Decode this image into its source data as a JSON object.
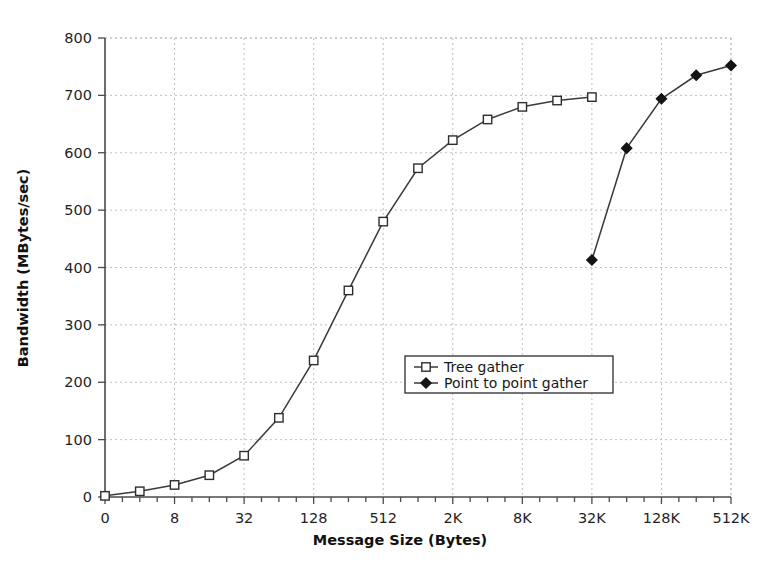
{
  "chart_data": {
    "type": "line",
    "title": "",
    "xlabel": "Message Size (Bytes)",
    "ylabel": "Bandwidth (MBytes/sec)",
    "ylim": [
      0,
      800
    ],
    "yticks": [
      0,
      100,
      200,
      300,
      400,
      500,
      600,
      700,
      800
    ],
    "ytick_labels": [
      "0",
      "100",
      "200",
      "300",
      "400",
      "500",
      "600",
      "700",
      "800"
    ],
    "x_tick_index_range": [
      0,
      36
    ],
    "x_labeled_tick_indices": [
      0,
      4,
      8,
      12,
      16,
      20,
      24,
      28,
      32,
      36
    ],
    "xtick_labels": [
      "0",
      "8",
      "32",
      "128",
      "512",
      "2K",
      "8K",
      "32K",
      "128K",
      "512K"
    ],
    "x_minor_ticks_between_labels": 3,
    "grid": true,
    "grid_style": "dotted",
    "legend_position": "center",
    "series": [
      {
        "name": "Tree gather",
        "marker": "open-square",
        "points": [
          {
            "xi": 0,
            "x": "0",
            "y": 2
          },
          {
            "xi": 2,
            "x": "4",
            "y": 10
          },
          {
            "xi": 4,
            "x": "8",
            "y": 21
          },
          {
            "xi": 6,
            "x": "16",
            "y": 38
          },
          {
            "xi": 8,
            "x": "32",
            "y": 72
          },
          {
            "xi": 10,
            "x": "64",
            "y": 138
          },
          {
            "xi": 12,
            "x": "128",
            "y": 238
          },
          {
            "xi": 14,
            "x": "256",
            "y": 360
          },
          {
            "xi": 16,
            "x": "512",
            "y": 480
          },
          {
            "xi": 18,
            "x": "1K",
            "y": 573
          },
          {
            "xi": 20,
            "x": "2K",
            "y": 622
          },
          {
            "xi": 22,
            "x": "4K",
            "y": 658
          },
          {
            "xi": 24,
            "x": "8K",
            "y": 680
          },
          {
            "xi": 26,
            "x": "16K",
            "y": 691
          },
          {
            "xi": 28,
            "x": "32K",
            "y": 697
          }
        ]
      },
      {
        "name": "Point to point gather",
        "marker": "filled-diamond",
        "points": [
          {
            "xi": 28,
            "x": "32K",
            "y": 413
          },
          {
            "xi": 30,
            "x": "64K",
            "y": 608
          },
          {
            "xi": 32,
            "x": "128K",
            "y": 694
          },
          {
            "xi": 34,
            "x": "256K",
            "y": 735
          },
          {
            "xi": 36,
            "x": "512K",
            "y": 752
          }
        ]
      }
    ]
  },
  "legend": {
    "entries": [
      {
        "label": "Tree gather"
      },
      {
        "label": "Point to point gather"
      }
    ]
  }
}
